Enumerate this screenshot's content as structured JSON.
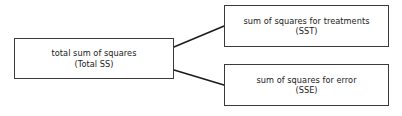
{
  "diagram": {
    "background_color": "#ffffff",
    "box_border_color": "#3a3a3a",
    "connector_color": "#1a1a1a",
    "nodes": [
      {
        "id": "total-ss",
        "line1": "total sum of squares",
        "line2": "(Total SS)"
      },
      {
        "id": "sst",
        "line1": "sum of squares for treatments",
        "line2": "(SST)"
      },
      {
        "id": "sse",
        "line1": "sum of squares for error",
        "line2": "(SSE)"
      }
    ],
    "connectors": [
      {
        "id": "total-to-sst",
        "from": "total-ss",
        "to": "sst"
      },
      {
        "id": "total-to-sse",
        "from": "total-ss",
        "to": "sse"
      }
    ]
  }
}
